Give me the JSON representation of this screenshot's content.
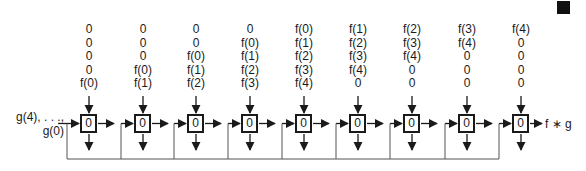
{
  "input": {
    "line1": "g(4), . . .,",
    "line2": "g(0)"
  },
  "output": {
    "label": "f ∗ g"
  },
  "cells": [
    {
      "value": "0",
      "stream": [
        "0",
        "0",
        "0",
        "0",
        "f(0)"
      ]
    },
    {
      "value": "0",
      "stream": [
        "0",
        "0",
        "0",
        "f(0)",
        "f(1)"
      ]
    },
    {
      "value": "0",
      "stream": [
        "0",
        "0",
        "f(0)",
        "f(1)",
        "f(2)"
      ]
    },
    {
      "value": "0",
      "stream": [
        "0",
        "f(0)",
        "f(1)",
        "f(2)",
        "f(3)"
      ]
    },
    {
      "value": "0",
      "stream": [
        "f(0)",
        "f(1)",
        "f(2)",
        "f(3)",
        "f(4)"
      ]
    },
    {
      "value": "0",
      "stream": [
        "f(1)",
        "f(2)",
        "f(3)",
        "f(4)",
        "0"
      ]
    },
    {
      "value": "0",
      "stream": [
        "f(2)",
        "f(3)",
        "f(4)",
        "0",
        "0"
      ]
    },
    {
      "value": "0",
      "stream": [
        "f(3)",
        "f(4)",
        "0",
        "0",
        "0"
      ]
    },
    {
      "value": "0",
      "stream": [
        "f(4)",
        "0",
        "0",
        "0",
        "0"
      ]
    }
  ],
  "colors": {
    "stroke": "#1a1a1a",
    "feedback": "#555555",
    "background": "#ffffff"
  }
}
